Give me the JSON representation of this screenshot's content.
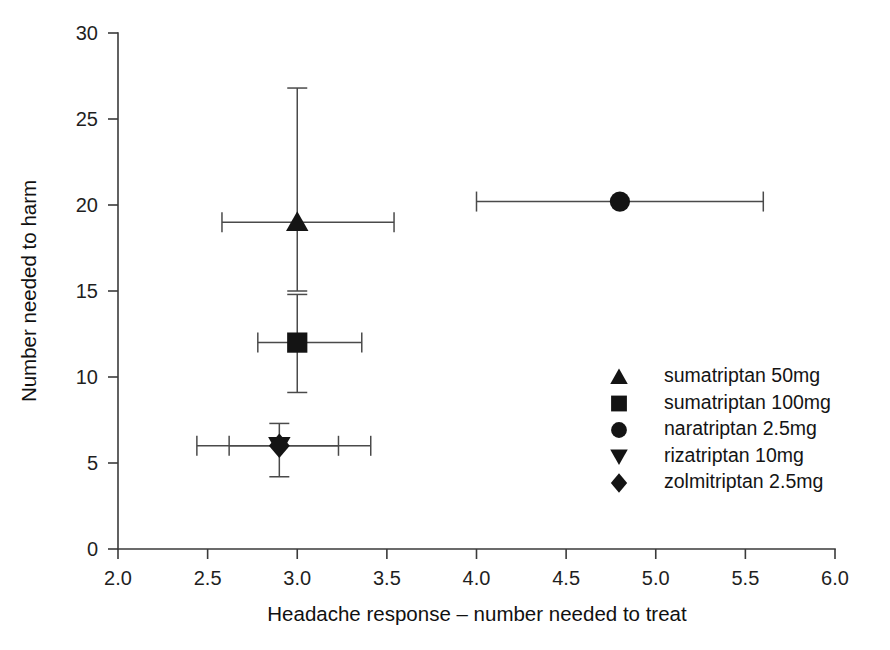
{
  "chart_data": {
    "type": "scatter",
    "title": "",
    "xlabel": "Headache response – number needed to treat",
    "ylabel": "Number needed to harm",
    "xlim": [
      2.0,
      6.0
    ],
    "ylim": [
      0,
      30
    ],
    "xticks": [
      "2.0",
      "2.5",
      "3.0",
      "3.5",
      "4.0",
      "4.5",
      "5.0",
      "5.5",
      "6.0"
    ],
    "xtick_values": [
      2.0,
      2.5,
      3.0,
      3.5,
      4.0,
      4.5,
      5.0,
      5.5,
      6.0
    ],
    "yticks": [
      "0",
      "5",
      "10",
      "15",
      "20",
      "25",
      "30"
    ],
    "ytick_values": [
      0,
      5,
      10,
      15,
      20,
      25,
      30
    ],
    "grid": false,
    "legend_position": "center-right",
    "error_bars": "both",
    "points": [
      {
        "label": "sumatriptan 50mg",
        "marker": "triangle-up",
        "x": 3.0,
        "y": 19.0,
        "x_low": 2.58,
        "x_high": 3.54,
        "y_low": 15.0,
        "y_high": 26.8
      },
      {
        "label": "sumatriptan 100mg",
        "marker": "square",
        "x": 3.0,
        "y": 12.0,
        "x_low": 2.78,
        "x_high": 3.36,
        "y_low": 9.1,
        "y_high": 14.8
      },
      {
        "label": "naratriptan 2.5mg",
        "marker": "circle",
        "x": 4.8,
        "y": 20.2,
        "x_low": 4.0,
        "x_high": 5.6,
        "y_low": 20.2,
        "y_high": 20.2
      },
      {
        "label": "rizatriptan 10mg",
        "marker": "triangle-down",
        "x": 2.9,
        "y": 6.0,
        "x_low": 2.44,
        "x_high": 3.41,
        "y_low": 6.0,
        "y_high": 6.0
      },
      {
        "label": "zolmitriptan 2.5mg",
        "marker": "diamond",
        "x": 2.9,
        "y": 6.0,
        "x_low": 2.62,
        "x_high": 3.23,
        "y_low": 4.2,
        "y_high": 7.3
      }
    ]
  },
  "legend": {
    "entries": [
      {
        "marker": "triangle-up",
        "label": "sumatriptan 50mg"
      },
      {
        "marker": "square",
        "label": "sumatriptan 100mg"
      },
      {
        "marker": "circle",
        "label": "naratriptan 2.5mg"
      },
      {
        "marker": "triangle-down",
        "label": "rizatriptan 10mg"
      },
      {
        "marker": "diamond",
        "label": "zolmitriptan 2.5mg"
      }
    ]
  },
  "colors": {
    "marker": "#141414",
    "error_bar": "#4a4a4a",
    "axis": "#3a3a3a",
    "text": "#141414",
    "background": "#ffffff"
  }
}
